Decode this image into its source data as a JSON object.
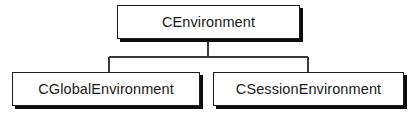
{
  "diagram": {
    "type": "class-inheritance-hierarchy",
    "background_color": "#ffffff",
    "line_color": "#3a3a3a",
    "border_color": "#1c1c1c",
    "shadow_color": "#0c0c0c",
    "text_color": "#1a1a1a",
    "nodes": {
      "root": {
        "label": "CEnvironment"
      },
      "children": [
        {
          "label": "CGlobalEnvironment"
        },
        {
          "label": "CSessionEnvironment"
        }
      ]
    },
    "connectors": {
      "trunk_x": 208,
      "trunk_top_y": 39,
      "bus_y": 57,
      "bus_left_x": 109,
      "bus_right_x": 308,
      "branch_bottom_y": 72
    }
  }
}
